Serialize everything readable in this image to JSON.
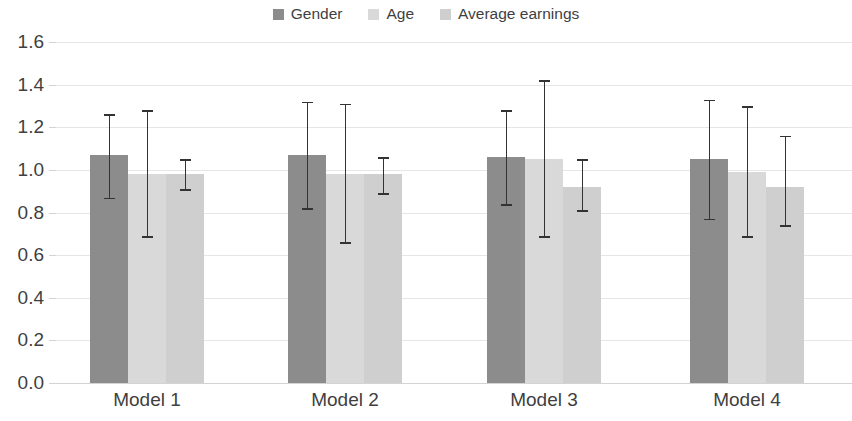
{
  "chart_data": {
    "type": "bar",
    "title": "",
    "subtitle": "",
    "xlabel": "",
    "ylabel": "",
    "categories": [
      "Model 1",
      "Model 2",
      "Model 3",
      "Model 4"
    ],
    "ylim": [
      0.0,
      1.6
    ],
    "ytick_labels": [
      "0.0",
      "0.2",
      "0.4",
      "0.6",
      "0.8",
      "1.0",
      "1.2",
      "1.4",
      "1.6"
    ],
    "ytick_values": [
      0.0,
      0.2,
      0.4,
      0.6,
      0.8,
      1.0,
      1.2,
      1.4,
      1.6
    ],
    "grid": true,
    "grid_axis": "y",
    "legend_position": "top-center",
    "error_bars": true,
    "series": [
      {
        "name": "Gender",
        "color": "#8c8c8c",
        "values": [
          1.07,
          1.07,
          1.06,
          1.05
        ],
        "err_high": [
          1.26,
          1.32,
          1.28,
          1.33
        ],
        "err_low": [
          0.87,
          0.82,
          0.84,
          0.77
        ]
      },
      {
        "name": "Age",
        "color": "#d9d9d9",
        "values": [
          0.98,
          0.98,
          1.05,
          0.99
        ],
        "err_high": [
          1.28,
          1.31,
          1.42,
          1.3
        ],
        "err_low": [
          0.69,
          0.66,
          0.69,
          0.69
        ]
      },
      {
        "name": "Average earnings",
        "color": "#cfcfcf",
        "values": [
          0.98,
          0.98,
          0.92,
          0.92
        ],
        "err_high": [
          1.05,
          1.06,
          1.05,
          1.16
        ],
        "err_low": [
          0.91,
          0.89,
          0.81,
          0.74
        ]
      }
    ]
  },
  "legend": {
    "items": [
      {
        "label": "Gender",
        "color": "#8c8c8c"
      },
      {
        "label": "Age",
        "color": "#d9d9d9"
      },
      {
        "label": "Average earnings",
        "color": "#cfcfcf"
      }
    ]
  },
  "axis": {
    "y_labels": [
      "1.6",
      "1.4",
      "1.2",
      "1.0",
      "0.8",
      "0.6",
      "0.4",
      "0.2",
      "0.0"
    ],
    "x_labels": [
      "Model 1",
      "Model 2",
      "Model 3",
      "Model 4"
    ]
  }
}
